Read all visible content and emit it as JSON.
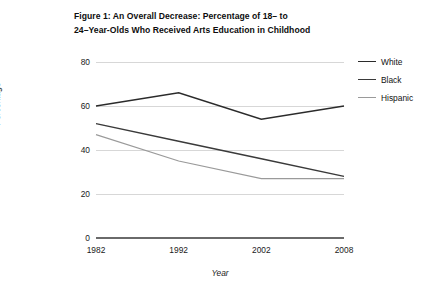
{
  "chart_data": {
    "type": "line",
    "title": "Figure 1: An Overall Decrease: Percentage of 18– to 24–Year-Olds Who Received Arts Education in Childhood",
    "title_lines": [
      "Figure 1: An Overall Decrease: Percentage of 18– to",
      "24–Year-Olds Who Received Arts Education in Childhood"
    ],
    "xlabel": "Year",
    "ylabel": "Percentage",
    "categories": [
      "1982",
      "1992",
      "2002",
      "2008"
    ],
    "x": [
      1982,
      1992,
      2002,
      2008
    ],
    "xlim": [
      1982,
      2008
    ],
    "ylim": [
      0,
      80
    ],
    "yticks": [
      0,
      20,
      40,
      60,
      80
    ],
    "xticks": [
      "1982",
      "1992",
      "2002",
      "2008"
    ],
    "grid": true,
    "grid_axis": "y",
    "legend_position": "right",
    "series": [
      {
        "name": "White",
        "values": [
          60,
          66,
          54,
          60
        ],
        "color": "#2b2b2b",
        "width": 1.5
      },
      {
        "name": "Black",
        "values": [
          52,
          44,
          36,
          28
        ],
        "color": "#3a3a3a",
        "width": 1.4
      },
      {
        "name": "Hispanic",
        "values": [
          47,
          35,
          27,
          27
        ],
        "color": "#9a9a9a",
        "width": 1.2
      }
    ]
  },
  "legend": {
    "items": [
      {
        "label": "White"
      },
      {
        "label": "Black"
      },
      {
        "label": "Hispanic"
      }
    ]
  }
}
